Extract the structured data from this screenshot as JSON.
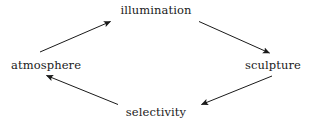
{
  "diagram": {
    "type": "cycle-diagram",
    "shape": "rhombus",
    "direction": "clockwise",
    "background_color": "#ffffff",
    "line_color": "#1a1a1a",
    "text_color": "#1a1a1a",
    "nodes": [
      {
        "id": "illumination",
        "label": "illumination",
        "position": "top"
      },
      {
        "id": "sculpture",
        "label": "sculpture",
        "position": "right"
      },
      {
        "id": "selectivity",
        "label": "selectivity",
        "position": "bottom"
      },
      {
        "id": "atmosphere",
        "label": "atmosphere",
        "position": "left"
      }
    ],
    "edges": [
      {
        "from": "atmosphere",
        "to": "illumination",
        "arrowhead": "end"
      },
      {
        "from": "illumination",
        "to": "sculpture",
        "arrowhead": "end"
      },
      {
        "from": "sculpture",
        "to": "selectivity",
        "arrowhead": "end"
      },
      {
        "from": "selectivity",
        "to": "atmosphere",
        "arrowhead": "end"
      }
    ]
  }
}
